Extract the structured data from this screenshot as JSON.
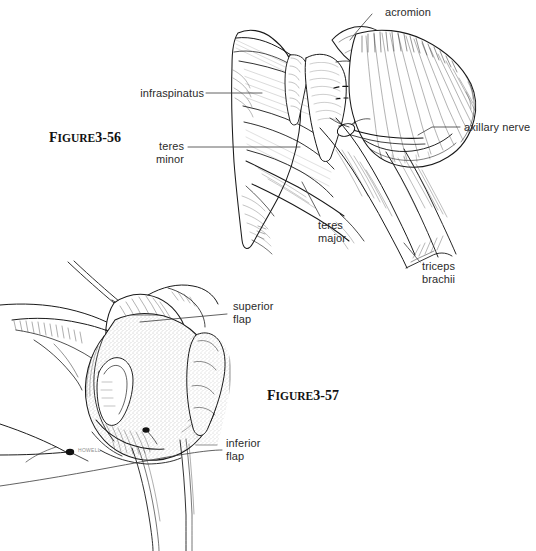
{
  "plate": {
    "background_color": "#ffffff",
    "ink_color": "#1a1a1a",
    "label_color": "#2b2b2b",
    "width": 536,
    "height": 551
  },
  "figures": [
    {
      "id": "figure-3-56",
      "caption_lead": "F",
      "caption_rest": "IGURE",
      "caption_number": "3-56",
      "caption_full": "FIGURE 3-56",
      "subject": "posterior shoulder dissection showing rotator cuff and axillary nerve"
    },
    {
      "id": "figure-3-57",
      "caption_lead": "F",
      "caption_rest": "IGURE",
      "caption_number": "3-57",
      "caption_full": "FIGURE 3-57",
      "subject": "posterior capsular shift with superior and inferior capsule flaps"
    }
  ],
  "callouts": [
    {
      "id": "acromion",
      "text": "acromion",
      "figure": "figure-3-56",
      "align": "left"
    },
    {
      "id": "infraspinatus",
      "text": "infraspinatus",
      "figure": "figure-3-56",
      "align": "right"
    },
    {
      "id": "teres-minor",
      "text": "teres\nminor",
      "line1": "teres",
      "line2": "minor",
      "figure": "figure-3-56",
      "align": "right"
    },
    {
      "id": "axillary-nerve",
      "text": "axillary nerve",
      "figure": "figure-3-56",
      "align": "left"
    },
    {
      "id": "teres-major",
      "text": "teres\nmajor",
      "line1": "teres",
      "line2": "major",
      "figure": "figure-3-56",
      "align": "left"
    },
    {
      "id": "triceps-brachii",
      "text": "triceps\nbrachii",
      "line1": "triceps",
      "line2": "brachii",
      "figure": "figure-3-56",
      "align": "left"
    },
    {
      "id": "superior-flap",
      "text": "superior\nflap",
      "line1": "superior",
      "line2": "flap",
      "figure": "figure-3-57",
      "align": "left"
    },
    {
      "id": "inferior-flap",
      "text": "inferior\nflap",
      "line1": "inferior",
      "line2": "flap",
      "figure": "figure-3-57",
      "align": "left"
    }
  ],
  "artist_signature": "HOWELL"
}
